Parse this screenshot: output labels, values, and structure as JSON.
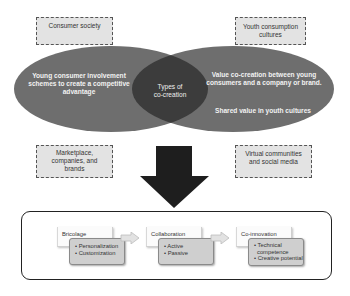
{
  "diagram": {
    "context_boxes": {
      "top_left": "Consumer society",
      "top_right_line1": "Youth consumption",
      "top_right_line2": "cultures",
      "bottom_left_line1": "Marketplace,",
      "bottom_left_line2": "companies, and",
      "bottom_left_line3": "brands",
      "bottom_right_line1": "Virtual communities",
      "bottom_right_line2": "and social media"
    },
    "venn": {
      "left_line1": "Young consumer involvement",
      "left_line2": "schemes to create a competitive",
      "left_line3": "advantage",
      "center_line1": "Types of",
      "center_line2": "co-creation",
      "right_top_line1": "Value co-creation between young",
      "right_top_line2": "consumers and a company or brand.",
      "right_bottom": "Shared value in youth cultures",
      "colors": {
        "ellipse": "#6e6e6e",
        "intersection": "#3c3c3c"
      }
    },
    "process": {
      "steps": [
        {
          "title": "Bricolage",
          "items": [
            "• Personalization",
            "• Customization"
          ]
        },
        {
          "title": "Collaboration",
          "items": [
            "• Active",
            "• Passive"
          ]
        },
        {
          "title": "Co-innovation",
          "items": [
            "• Technical",
            "  competence",
            "• Creative potential"
          ]
        }
      ]
    }
  }
}
